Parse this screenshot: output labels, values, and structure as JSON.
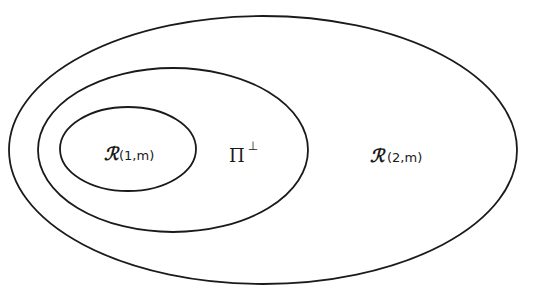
{
  "diagram": {
    "type": "nested-sets",
    "stroke_color": "#1a1a1a",
    "background": "#ffffff",
    "sets": [
      {
        "id": "outer",
        "symbol": "ℛ",
        "args": "(2,m)",
        "label": "ℛ(2,m)",
        "ellipse": {
          "cx": 263,
          "cy": 150,
          "rx": 254,
          "ry": 134
        }
      },
      {
        "id": "middle",
        "symbol": "Π",
        "superscript": "⊥",
        "label": "Π⊥",
        "ellipse": {
          "cx": 173,
          "cy": 150,
          "rx": 135,
          "ry": 82
        }
      },
      {
        "id": "inner",
        "symbol": "ℛ",
        "args": "(1,m)",
        "label": "ℛ(1,m)",
        "ellipse": {
          "cx": 128,
          "cy": 149,
          "rx": 68,
          "ry": 42
        }
      }
    ],
    "relation": "ℛ(1,m) ⊂ Π⊥ ⊂ ℛ(2,m)"
  }
}
